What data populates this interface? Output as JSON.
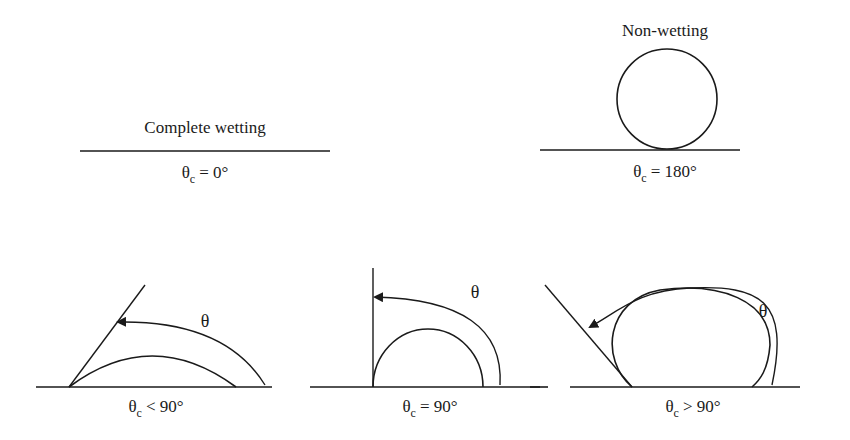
{
  "diagram": {
    "panels": [
      {
        "id": "complete",
        "title": "Complete wetting",
        "theta_symbol": "θ",
        "subscript": "c",
        "relation": "= 0°"
      },
      {
        "id": "nonwetting",
        "title": "Non-wetting",
        "theta_symbol": "θ",
        "subscript": "c",
        "relation": "= 180°"
      },
      {
        "id": "lt90",
        "angle_label": "θ",
        "theta_symbol": "θ",
        "subscript": "c",
        "relation": "< 90°"
      },
      {
        "id": "eq90",
        "angle_label": "θ",
        "theta_symbol": "θ",
        "subscript": "c",
        "relation": "= 90°"
      },
      {
        "id": "gt90",
        "angle_label": "θ",
        "theta_symbol": "θ",
        "subscript": "c",
        "relation": "> 90°"
      }
    ],
    "colors": {
      "line": "#1a1a1a",
      "background": "#ffffff"
    }
  }
}
